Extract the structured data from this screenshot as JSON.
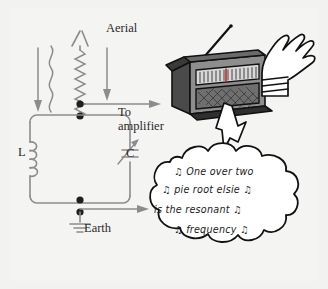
{
  "figure": {
    "background_color": "#f4f4f2",
    "ink_color": "#2a2a2a",
    "circuit_line_color": "#8c8c8c"
  },
  "circuit": {
    "aerial_label": "Aerial",
    "to_label": "To",
    "amplifier_label": "amplifier",
    "inductor_label": "L",
    "capacitor_label": "C",
    "earth_label": "Earth",
    "icons": {
      "aerial": "aerial-icon",
      "wave": "radio-wave-icon",
      "arrow_down_left": "down-arrow-icon",
      "arrow_down_right": "down-arrow-icon",
      "inductor": "inductor-coil-icon",
      "capacitor": "variable-capacitor-icon",
      "earth": "ground-symbol-icon",
      "junction": "junction-dot-icon",
      "output_arrow_top": "right-arrow-icon",
      "output_arrow_bottom": "right-arrow-icon"
    }
  },
  "radio": {
    "icons": {
      "body": "radio-body-icon",
      "antenna": "telescopic-antenna-icon",
      "dial": "tuning-dial-icon",
      "speaker": "speaker-grille-icon",
      "hand": "cartoon-hand-icon"
    },
    "dial_tick_count": 17
  },
  "speech_bubble": {
    "icons": {
      "cloud": "speech-bubble-cloud-icon",
      "tail": "speech-bubble-tail-icon"
    },
    "lines": [
      "♫ One over two",
      "♫ pie root elsie ♫",
      "is the resonant ♫",
      "♫    frequency ♫"
    ],
    "plain_text": "One over two pie root elsie is the resonant frequency",
    "note_glyph": "♫"
  }
}
